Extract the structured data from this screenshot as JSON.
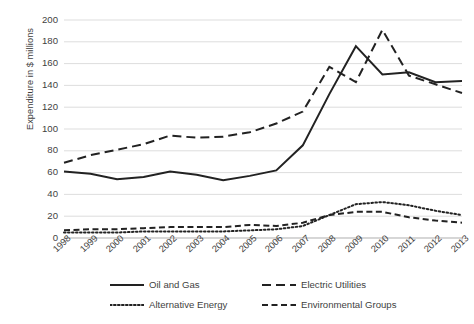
{
  "chart_data": {
    "type": "line",
    "title": "",
    "xlabel": "",
    "ylabel": "Expenditure in $ millions",
    "categories": [
      "1998",
      "1999",
      "2000",
      "2001",
      "2002",
      "2003",
      "2004",
      "2005",
      "2006",
      "2007",
      "2008",
      "2009",
      "2010",
      "2011",
      "2012",
      "2013"
    ],
    "x": [
      1998,
      1999,
      2000,
      2001,
      2002,
      2003,
      2004,
      2005,
      2006,
      2007,
      2008,
      2009,
      2010,
      2011,
      2012,
      2013
    ],
    "ylim": [
      0,
      200
    ],
    "yticks": [
      0,
      20,
      40,
      60,
      80,
      100,
      120,
      140,
      160,
      180,
      200
    ],
    "grid": true,
    "legend_position": "bottom",
    "series": [
      {
        "name": "Oil and Gas",
        "style": "solid",
        "color": "#222222",
        "values": [
          61,
          59,
          54,
          56,
          61,
          58,
          53,
          57,
          62,
          85,
          132,
          176,
          150,
          152,
          143,
          144
        ]
      },
      {
        "name": "Electric Utilities",
        "style": "long-dash",
        "color": "#222222",
        "values": [
          69,
          76,
          81,
          86,
          94,
          92,
          93,
          97,
          105,
          116,
          157,
          143,
          191,
          149,
          141,
          133
        ]
      },
      {
        "name": "Alternative Energy",
        "style": "dotted",
        "color": "#222222",
        "values": [
          5,
          5,
          5,
          6,
          6,
          6,
          6,
          7,
          8,
          11,
          21,
          31,
          33,
          30,
          25,
          21
        ]
      },
      {
        "name": "Environmental Groups",
        "style": "dash",
        "color": "#222222",
        "values": [
          7,
          8,
          8,
          9,
          10,
          10,
          10,
          12,
          11,
          14,
          21,
          24,
          24,
          19,
          16,
          14
        ]
      }
    ]
  },
  "legend": {
    "items": [
      {
        "label": "Oil and Gas",
        "key": "solid-line-key"
      },
      {
        "label": "Electric Utilities",
        "key": "long-dash-line-key"
      },
      {
        "label": "Alternative Energy",
        "key": "dotted-line-key"
      },
      {
        "label": "Environmental Groups",
        "key": "dash-line-key"
      }
    ]
  }
}
